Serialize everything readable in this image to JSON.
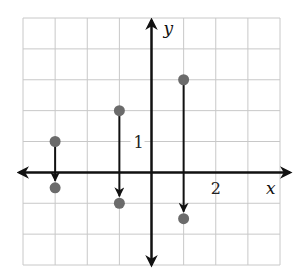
{
  "chart_data": {
    "type": "scatter",
    "title": "",
    "xlabel": "x",
    "ylabel": "y",
    "xlim": [
      -4,
      4
    ],
    "ylim": [
      -3,
      5
    ],
    "grid": true,
    "tick_labels": [
      {
        "axis": "y",
        "value": 1,
        "text": "1"
      },
      {
        "axis": "x",
        "value": 2,
        "text": "2"
      }
    ],
    "mappings": [
      {
        "from": {
          "x": -3,
          "y": 1
        },
        "to": {
          "x": -3,
          "y": -0.5
        }
      },
      {
        "from": {
          "x": -1,
          "y": 2
        },
        "to": {
          "x": -1,
          "y": -1
        }
      },
      {
        "from": {
          "x": 1,
          "y": 3
        },
        "to": {
          "x": 1,
          "y": -1.5
        }
      }
    ],
    "colors": {
      "grid": "#c8c8c8",
      "axis": "#111111",
      "dot": "#6b6b6b"
    }
  }
}
